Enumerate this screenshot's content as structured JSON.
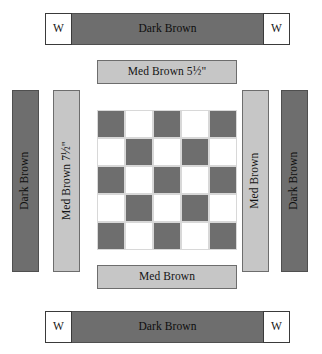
{
  "diagram": {
    "colors": {
      "dark_brown": "#6e6e6e",
      "med_brown": "#c6c6c6",
      "white": "#ffffff",
      "outline": "#4a4a4a"
    }
  },
  "top_rail": {
    "left_w_label": "W",
    "bar_label": "Dark Brown",
    "right_w_label": "W"
  },
  "top_strip": {
    "label": "Med Brown 5½\""
  },
  "left_strips": [
    {
      "label": "Dark Brown",
      "fabric": "dark"
    },
    {
      "label": "Med Brown 7½\"",
      "fabric": "med"
    }
  ],
  "right_strips": [
    {
      "label": "Med Brown",
      "fabric": "med"
    },
    {
      "label": "Dark Brown",
      "fabric": "dark"
    }
  ],
  "bottom_strip": {
    "label": "Med Brown"
  },
  "bottom_rail": {
    "left_w_label": "W",
    "bar_label": "Dark Brown",
    "right_w_label": "W"
  },
  "checkerboard": {
    "rows": 5,
    "columns": 5,
    "grid": [
      [
        "dark",
        "light",
        "dark",
        "light",
        "dark"
      ],
      [
        "light",
        "dark",
        "light",
        "dark",
        "light"
      ],
      [
        "dark",
        "light",
        "dark",
        "light",
        "dark"
      ],
      [
        "light",
        "dark",
        "light",
        "dark",
        "light"
      ],
      [
        "dark",
        "light",
        "dark",
        "light",
        "dark"
      ]
    ]
  }
}
